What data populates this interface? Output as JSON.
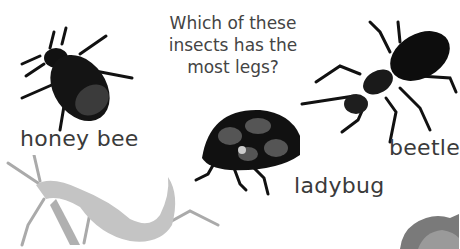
{
  "question": {
    "line1": "Which of these",
    "line2": "insects has the",
    "line3": "most legs?"
  },
  "insects": [
    {
      "name": "honey bee",
      "icon": "bee-icon"
    },
    {
      "name": "beetle",
      "icon": "beetle-icon"
    },
    {
      "name": "ladybug",
      "icon": "ladybug-icon"
    },
    {
      "name": "",
      "icon": "praying-mantis-icon"
    },
    {
      "name": "",
      "icon": "partial-insect-icon"
    }
  ],
  "colors": {
    "text": "#3a3a3a",
    "insect_dark": "#111111",
    "ladybug_spots": "#555555",
    "mantis": "#b8b8b8"
  }
}
